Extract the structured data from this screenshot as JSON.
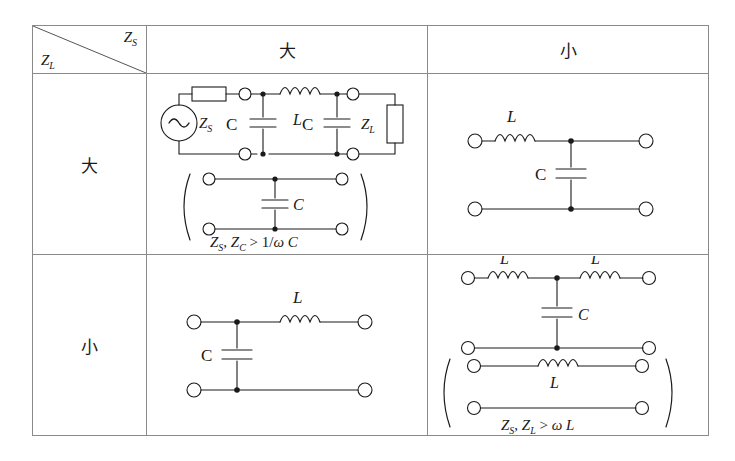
{
  "figure": {
    "type": "impedance-matching-network-table",
    "axis_labels": {
      "source_impedance": "Z",
      "source_impedance_sub": "S",
      "load_impedance": "Z",
      "load_impedance_sub": "L"
    },
    "column_headers": [
      "大",
      "小"
    ],
    "row_headers": [
      "大",
      "小"
    ]
  },
  "cells": {
    "large_large": {
      "primary": {
        "name": "pi-network-with-source-and-load",
        "source_label": "Z",
        "source_label_sub": "S",
        "load_label": "Z",
        "load_label_sub": "L",
        "series_inductor_label": "L",
        "shunt_cap_left_label": "C",
        "shunt_cap_right_label": "C"
      },
      "alternate": {
        "name": "shunt-capacitor-only",
        "cap_label": "C",
        "condition": "Z",
        "condition_full": "Z_S, Z_C > 1/ω C",
        "cond_a": "Z",
        "cond_a_sub": "S",
        "cond_b": "Z",
        "cond_b_sub": "C",
        "cond_rel": "> 1/",
        "cond_omega": "ω",
        "cond_tail": "C"
      }
    },
    "large_small": {
      "primary": {
        "name": "l-section-series-L-shunt-C",
        "series_inductor_label": "L",
        "shunt_cap_label": "C"
      }
    },
    "small_large": {
      "primary": {
        "name": "l-section-shunt-C-series-L",
        "series_inductor_label": "L",
        "shunt_cap_label": "C"
      }
    },
    "small_small": {
      "primary": {
        "name": "t-network-L-C-L",
        "series_inductor_left_label": "L",
        "series_inductor_right_label": "L",
        "shunt_cap_label": "C"
      },
      "alternate": {
        "name": "series-inductor-only",
        "inductor_label": "L",
        "condition_full": "Z_S, Z_L > ω L",
        "cond_a": "Z",
        "cond_a_sub": "S",
        "cond_b": "Z",
        "cond_b_sub": "L",
        "cond_rel": ">",
        "cond_omega": "ω",
        "cond_tail": "L"
      }
    }
  },
  "colors": {
    "ink": "#1a1a1a",
    "border": "#8a8a8a",
    "background": "#ffffff"
  }
}
